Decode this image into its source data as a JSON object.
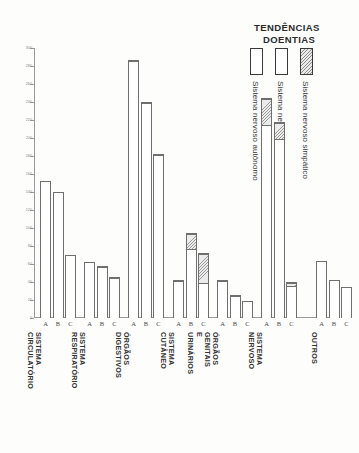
{
  "legend": {
    "title_line1": "TENDÊNCIAS",
    "title_line2": "DOENTIAS",
    "entries": [
      {
        "label": "Sistema nervoso autônomo",
        "swatch": "open-white",
        "color": "#ffffff"
      },
      {
        "label": "Sistema nervoso parassimpático",
        "swatch": "open-white",
        "color": "#ffffff"
      },
      {
        "label": "Sistema nervoso simpático",
        "swatch": "hatched-grey",
        "color": "#9a9a9a"
      }
    ]
  },
  "axis": {
    "y_ticks": [
      0,
      20,
      40,
      60,
      80,
      100,
      120,
      140,
      160,
      180,
      200,
      220,
      240,
      260,
      280,
      300
    ],
    "bar_letters": [
      "A",
      "B",
      "C"
    ]
  },
  "chart_data": {
    "type": "bar",
    "title": "TENDÊNCIAS DOENTIAS",
    "xlabel": "",
    "ylabel": "",
    "ylim": [
      0,
      300
    ],
    "grid": false,
    "stacked": true,
    "legend_position": "top-right",
    "categories": [
      "SISTEMA CIRCULATÓRIO",
      "SISTEMA RESPIRATÓRIO",
      "ÓRGÃOS DIGESTIVOS",
      "SISTEMA CUTÂNEO",
      "ÓRGÃOS GENITAIS E URINÁRIOS",
      "SISTEMA NERVOSO",
      "OUTROS"
    ],
    "subcategories": [
      "A",
      "B",
      "C"
    ],
    "series": [
      {
        "name": "Sistema nervoso autônomo",
        "swatch": "open-white"
      },
      {
        "name": "Sistema nervoso parassimpático",
        "swatch": "open-white"
      },
      {
        "name": "Sistema nervoso simpático",
        "swatch": "hatched-grey"
      }
    ],
    "groups": [
      {
        "category": "SISTEMA CIRCULATÓRIO",
        "bars": [
          {
            "letter": "A",
            "total": 152,
            "segments": [
              152,
              0,
              0
            ]
          },
          {
            "letter": "B",
            "total": 140,
            "segments": [
              140,
              0,
              0
            ]
          },
          {
            "letter": "C",
            "total": 70,
            "segments": [
              70,
              0,
              0
            ]
          }
        ]
      },
      {
        "category": "SISTEMA RESPIRATÓRIO",
        "bars": [
          {
            "letter": "A",
            "total": 62,
            "segments": [
              62,
              0,
              0
            ]
          },
          {
            "letter": "B",
            "total": 58,
            "segments": [
              46,
              12,
              0
            ]
          },
          {
            "letter": "C",
            "total": 46,
            "segments": [
              39,
              7,
              0
            ]
          }
        ]
      },
      {
        "category": "ÓRGÃOS DIGESTIVOS",
        "bars": [
          {
            "letter": "A",
            "total": 287,
            "segments": [
              258,
              29,
              0
            ]
          },
          {
            "letter": "B",
            "total": 240,
            "segments": [
              172,
              68,
              0
            ]
          },
          {
            "letter": "C",
            "total": 182,
            "segments": [
              146,
              36,
              0
            ]
          }
        ]
      },
      {
        "category": "SISTEMA CUTÂNEO",
        "bars": [
          {
            "letter": "A",
            "total": 42,
            "segments": [
              33,
              9,
              0
            ]
          },
          {
            "letter": "B",
            "total": 95,
            "segments": [
              33,
              45,
              17
            ]
          },
          {
            "letter": "C",
            "total": 72,
            "segments": [
              18,
              22,
              32
            ]
          }
        ]
      },
      {
        "category": "ÓRGÃOS GENITAIS E URINÁRIOS",
        "bars": [
          {
            "letter": "A",
            "total": 42,
            "segments": [
              33,
              9,
              0
            ]
          },
          {
            "letter": "B",
            "total": 26,
            "segments": [
              14,
              12,
              0
            ]
          },
          {
            "letter": "C",
            "total": 19,
            "segments": [
              19,
              0,
              0
            ]
          }
        ]
      },
      {
        "category": "SISTEMA NERVOSO",
        "bars": [
          {
            "letter": "A",
            "total": 245,
            "segments": [
              145,
              70,
              30
            ]
          },
          {
            "letter": "B",
            "total": 218,
            "segments": [
              83,
              117,
              18
            ]
          },
          {
            "letter": "C",
            "total": 40,
            "segments": [
              33,
              4,
              3
            ]
          }
        ]
      },
      {
        "category": "OUTROS",
        "bars": [
          {
            "letter": "A",
            "total": 63,
            "segments": [
              63,
              0,
              0
            ]
          },
          {
            "letter": "B",
            "total": 42,
            "segments": [
              42,
              0,
              0
            ]
          },
          {
            "letter": "C",
            "total": 35,
            "segments": [
              35,
              0,
              0
            ]
          }
        ]
      }
    ]
  }
}
